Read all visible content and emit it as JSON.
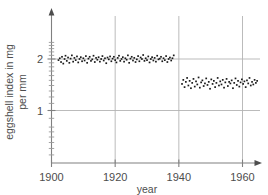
{
  "chart_data": {
    "type": "scatter",
    "title": "",
    "xlabel": "year",
    "ylabel": "eggshell index in mg per mm",
    "ylabel_line1": "eggshell index in mg",
    "ylabel_line2": "per mm",
    "xlim": [
      1900,
      1965
    ],
    "ylim": [
      0.78,
      2.55
    ],
    "yscale": "log",
    "xscale": "linear",
    "grid": true,
    "grid_x_values": [
      1920,
      1940,
      1960
    ],
    "grid_y_values": [
      1,
      2
    ],
    "legend": "none",
    "xticks": [
      1900,
      1920,
      1940,
      1960
    ],
    "xticklabels": [
      "1900",
      "1920",
      "1940",
      "1960"
    ],
    "yticks": [
      1,
      2
    ],
    "yticklabels": [
      "1",
      "2"
    ],
    "y_minor_ticks": [
      0.8,
      0.9,
      1.1,
      1.2,
      1.3,
      1.4,
      1.5,
      1.6,
      1.7,
      1.8,
      1.9,
      2.1,
      2.2,
      2.3,
      2.4,
      2.5
    ],
    "marker": "square",
    "marker_color": "#1a1a1a",
    "marker_size": 1.7,
    "series": [
      {
        "name": "pre-1940 eggshell index",
        "points": [
          [
            1902.2,
            1.97
          ],
          [
            1902.6,
            2.02
          ],
          [
            1903.0,
            1.92
          ],
          [
            1903.3,
            2.06
          ],
          [
            1903.7,
            1.88
          ],
          [
            1904.1,
            2.0
          ],
          [
            1904.4,
            2.09
          ],
          [
            1904.8,
            1.95
          ],
          [
            1905.2,
            2.04
          ],
          [
            1905.6,
            1.9
          ],
          [
            1906.0,
            2.01
          ],
          [
            1906.4,
            2.1
          ],
          [
            1906.8,
            1.93
          ],
          [
            1907.2,
            2.03
          ],
          [
            1907.6,
            1.97
          ],
          [
            1908.0,
            2.07
          ],
          [
            1908.4,
            1.91
          ],
          [
            1908.8,
            2.0
          ],
          [
            1909.2,
            2.05
          ],
          [
            1909.6,
            1.94
          ],
          [
            1910.0,
            2.02
          ],
          [
            1910.4,
            1.96
          ],
          [
            1910.8,
            2.08
          ],
          [
            1911.2,
            1.9
          ],
          [
            1911.6,
            2.01
          ],
          [
            1912.0,
            2.06
          ],
          [
            1912.4,
            1.95
          ],
          [
            1912.8,
            1.99
          ],
          [
            1913.2,
            2.09
          ],
          [
            1913.6,
            1.92
          ],
          [
            1914.0,
            2.03
          ],
          [
            1914.4,
            1.98
          ],
          [
            1914.8,
            2.05
          ],
          [
            1915.2,
            1.93
          ],
          [
            1915.6,
            2.0
          ],
          [
            1916.0,
            2.08
          ],
          [
            1916.4,
            1.96
          ],
          [
            1916.8,
            2.02
          ],
          [
            1917.2,
            1.89
          ],
          [
            1917.6,
            2.04
          ],
          [
            1918.0,
            1.99
          ],
          [
            1918.4,
            2.07
          ],
          [
            1918.8,
            1.94
          ],
          [
            1919.2,
            2.01
          ],
          [
            1919.6,
            2.06
          ],
          [
            1920.0,
            1.97
          ],
          [
            1920.4,
            1.91
          ],
          [
            1920.8,
            2.03
          ],
          [
            1921.2,
            2.09
          ],
          [
            1921.6,
            1.95
          ],
          [
            1922.0,
            2.0
          ],
          [
            1922.4,
            2.05
          ],
          [
            1922.8,
            1.93
          ],
          [
            1923.2,
            2.02
          ],
          [
            1923.6,
            1.98
          ],
          [
            1924.0,
            2.1
          ],
          [
            1924.4,
            1.9
          ],
          [
            1924.8,
            2.01
          ],
          [
            1925.2,
            2.06
          ],
          [
            1925.6,
            1.96
          ],
          [
            1926.0,
            2.03
          ],
          [
            1926.4,
            1.92
          ],
          [
            1926.8,
            1.99
          ],
          [
            1927.2,
            2.08
          ],
          [
            1927.6,
            1.94
          ],
          [
            1928.0,
            2.04
          ],
          [
            1928.4,
            2.0
          ],
          [
            1928.8,
            2.11
          ],
          [
            1929.2,
            1.95
          ],
          [
            1929.6,
            2.02
          ],
          [
            1930.0,
            1.97
          ],
          [
            1930.4,
            2.07
          ],
          [
            1930.8,
            1.91
          ],
          [
            1931.2,
            2.0
          ],
          [
            1931.6,
            2.05
          ],
          [
            1932.0,
            1.96
          ],
          [
            1932.4,
            2.03
          ],
          [
            1932.8,
            1.93
          ],
          [
            1933.2,
            2.09
          ],
          [
            1933.6,
            1.99
          ],
          [
            1934.0,
            2.01
          ],
          [
            1934.4,
            2.06
          ],
          [
            1934.8,
            1.94
          ],
          [
            1935.2,
            2.02
          ],
          [
            1935.6,
            1.97
          ],
          [
            1936.0,
            2.08
          ],
          [
            1936.4,
            1.92
          ],
          [
            1936.8,
            2.0
          ],
          [
            1937.2,
            2.04
          ],
          [
            1937.6,
            1.96
          ],
          [
            1938.0,
            2.02
          ],
          [
            1938.4,
            2.1
          ]
        ]
      },
      {
        "name": "post-1940 eggshell index",
        "points": [
          [
            1941.0,
            1.43
          ],
          [
            1941.4,
            1.51
          ],
          [
            1941.8,
            1.37
          ],
          [
            1942.2,
            1.47
          ],
          [
            1942.6,
            1.55
          ],
          [
            1943.0,
            1.4
          ],
          [
            1943.4,
            1.49
          ],
          [
            1943.8,
            1.35
          ],
          [
            1944.2,
            1.45
          ],
          [
            1944.6,
            1.53
          ],
          [
            1945.0,
            1.38
          ],
          [
            1945.4,
            1.48
          ],
          [
            1945.8,
            1.42
          ],
          [
            1946.2,
            1.56
          ],
          [
            1946.6,
            1.36
          ],
          [
            1947.0,
            1.46
          ],
          [
            1947.4,
            1.5
          ],
          [
            1947.8,
            1.39
          ],
          [
            1948.2,
            1.44
          ],
          [
            1948.6,
            1.54
          ],
          [
            1949.0,
            1.41
          ],
          [
            1949.4,
            1.47
          ],
          [
            1949.8,
            1.34
          ],
          [
            1950.2,
            1.52
          ],
          [
            1950.6,
            1.43
          ],
          [
            1951.0,
            1.49
          ],
          [
            1951.4,
            1.37
          ],
          [
            1951.8,
            1.45
          ],
          [
            1952.2,
            1.55
          ],
          [
            1952.6,
            1.4
          ],
          [
            1953.0,
            1.48
          ],
          [
            1953.4,
            1.42
          ],
          [
            1953.8,
            1.51
          ],
          [
            1954.2,
            1.36
          ],
          [
            1954.6,
            1.46
          ],
          [
            1955.0,
            1.53
          ],
          [
            1955.4,
            1.39
          ],
          [
            1955.8,
            1.47
          ],
          [
            1956.2,
            1.44
          ],
          [
            1956.6,
            1.5
          ],
          [
            1957.0,
            1.35
          ],
          [
            1957.4,
            1.45
          ],
          [
            1957.8,
            1.54
          ],
          [
            1958.2,
            1.41
          ],
          [
            1958.6,
            1.49
          ],
          [
            1959.0,
            1.38
          ],
          [
            1959.4,
            1.46
          ],
          [
            1959.8,
            1.52
          ],
          [
            1960.2,
            1.43
          ],
          [
            1960.6,
            1.48
          ],
          [
            1961.0,
            1.37
          ],
          [
            1961.4,
            1.5
          ],
          [
            1961.8,
            1.44
          ],
          [
            1962.2,
            1.55
          ],
          [
            1962.6,
            1.4
          ],
          [
            1963.0,
            1.47
          ],
          [
            1963.4,
            1.42
          ],
          [
            1963.8,
            1.51
          ],
          [
            1964.2,
            1.45
          ],
          [
            1964.6,
            1.49
          ]
        ]
      }
    ]
  }
}
